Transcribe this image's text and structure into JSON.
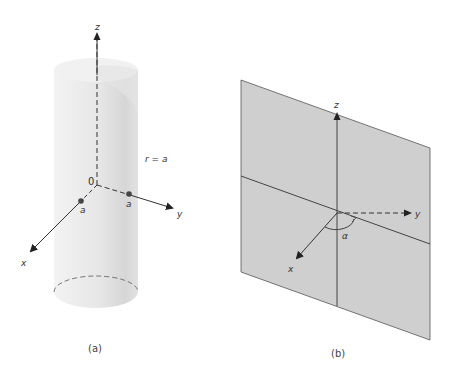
{
  "panels": [
    {
      "id": "a",
      "caption": "(a)",
      "description": "Infinite cylinder of radius a centered on z-axis",
      "labels": {
        "z_axis": "z",
        "x_axis": "x",
        "y_axis": "y",
        "origin": "0",
        "radius_eq": "r = a",
        "point_x": "a",
        "point_y": "a"
      }
    },
    {
      "id": "b",
      "caption": "(b)",
      "description": "Half-plane at angle alpha containing z-axis",
      "labels": {
        "z_axis": "z",
        "x_axis": "x",
        "y_axis": "y",
        "angle": "α"
      }
    }
  ],
  "colors": {
    "plane_fill": "#cfcfcf",
    "cylinder_fill": "#ececec",
    "line": "#444444"
  }
}
